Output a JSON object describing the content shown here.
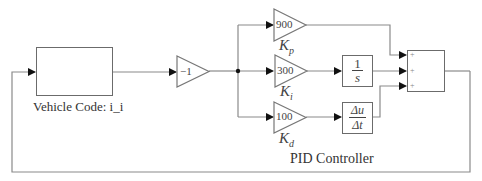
{
  "diagram": {
    "title": "PID Controller",
    "vehicle_block": {
      "label": "Vehicle Code: i_i",
      "icon": "car-icon"
    },
    "negate_gain": {
      "value": "−1"
    },
    "gains": [
      {
        "name": "Kp",
        "symbol": "K",
        "subscript": "p",
        "value": "900"
      },
      {
        "name": "Ki",
        "symbol": "K",
        "subscript": "i",
        "value": "300"
      },
      {
        "name": "Kd",
        "symbol": "K",
        "subscript": "d",
        "value": "100"
      }
    ],
    "integrator": {
      "numerator": "1",
      "denominator": "s"
    },
    "derivative": {
      "numerator": "Δu",
      "denominator": "Δt"
    },
    "sum_block": {
      "signs": [
        "+",
        "+",
        "+"
      ]
    },
    "colors": {
      "line": "#8a8a8a",
      "block_border": "#6b6b6b",
      "arrow": "#111111",
      "car": "#555555"
    }
  }
}
